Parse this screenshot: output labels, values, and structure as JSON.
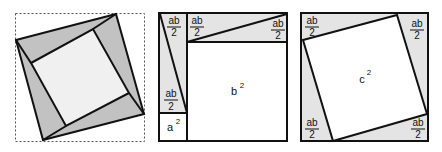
{
  "colors": {
    "shade": "#c2c2c2",
    "light_shade": "#e4e4e4",
    "inner_fill": "#f0f0f0",
    "white": "#ffffff",
    "stroke": "#111111",
    "dashed": "#555555"
  },
  "panels": [
    {
      "id": "rotated-squares",
      "description": "Two nested rotated squares in dashed bounding box"
    },
    {
      "id": "a2-b2",
      "labels": {
        "tri_left_top": {
          "num": "ab",
          "den": "2"
        },
        "tri_left_bottom": {
          "num": "ab",
          "den": "2"
        },
        "tri_top_left": {
          "num": "ab",
          "den": "2"
        },
        "tri_top_right": {
          "num": "ab",
          "den": "2"
        },
        "a_sq": {
          "base": "a",
          "exp": "2"
        },
        "b_sq": {
          "base": "b",
          "exp": "2"
        }
      }
    },
    {
      "id": "c2",
      "labels": {
        "tri_tl": {
          "num": "ab",
          "den": "2"
        },
        "tri_tr": {
          "num": "ab",
          "den": "2"
        },
        "tri_bl": {
          "num": "ab",
          "den": "2"
        },
        "tri_br": {
          "num": "ab",
          "den": "2"
        },
        "c_sq": {
          "base": "c",
          "exp": "2"
        }
      }
    }
  ]
}
